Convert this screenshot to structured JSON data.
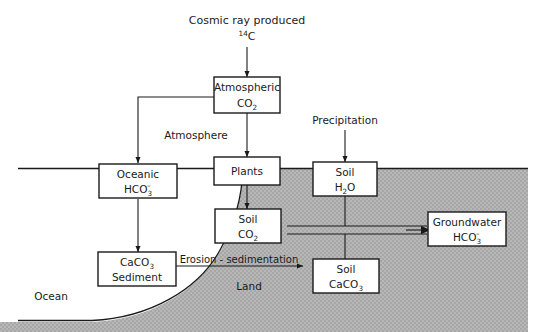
{
  "diagram": {
    "colors": {
      "land_shading": "#b2b2b2",
      "ocean_fill": "#ffffff",
      "line": "#1a1a1a",
      "box_fill": "#ffffff",
      "text": "#1a1a1a"
    },
    "source_label": {
      "line1": "Cosmic ray produced",
      "sup": "14",
      "element": "C"
    },
    "nodes": [
      {
        "id": "atmospheric_co2",
        "line1": "Atmospheric",
        "line2_base": "CO",
        "line2_sub": "2",
        "line2_sup": ""
      },
      {
        "id": "oceanic_hco3",
        "line1": "Oceanic",
        "line2_base": "HCO",
        "line2_sub": "3",
        "line2_sup": "–"
      },
      {
        "id": "plants",
        "line1": "Plants",
        "line2_base": "",
        "line2_sub": "",
        "line2_sup": ""
      },
      {
        "id": "soil_h2o",
        "line1": "Soil",
        "line2_base": "H",
        "line2_sub": "2",
        "line2_sub_tail": "O",
        "line2_sup": ""
      },
      {
        "id": "soil_co2",
        "line1": "Soil",
        "line2_base": "CO",
        "line2_sub": "2",
        "line2_sup": ""
      },
      {
        "id": "caco3_sediment",
        "line1_base": "CaCO",
        "line1_sub": "3",
        "line2": "Sediment"
      },
      {
        "id": "soil_caco3",
        "line1": "Soil",
        "line2_base": "CaCO",
        "line2_sub": "3",
        "line2_sup": ""
      },
      {
        "id": "groundwater_hco3",
        "line1": "Groundwater",
        "line2_base": "HCO",
        "line2_sub": "3",
        "line2_sup": "–"
      }
    ],
    "region_labels": {
      "atmosphere": "Atmosphere",
      "ocean": "Ocean",
      "land": "Land",
      "precipitation": "Precipitation"
    },
    "edge_labels": {
      "erosion_sedimentation": "Erosion - sedimentation"
    }
  }
}
